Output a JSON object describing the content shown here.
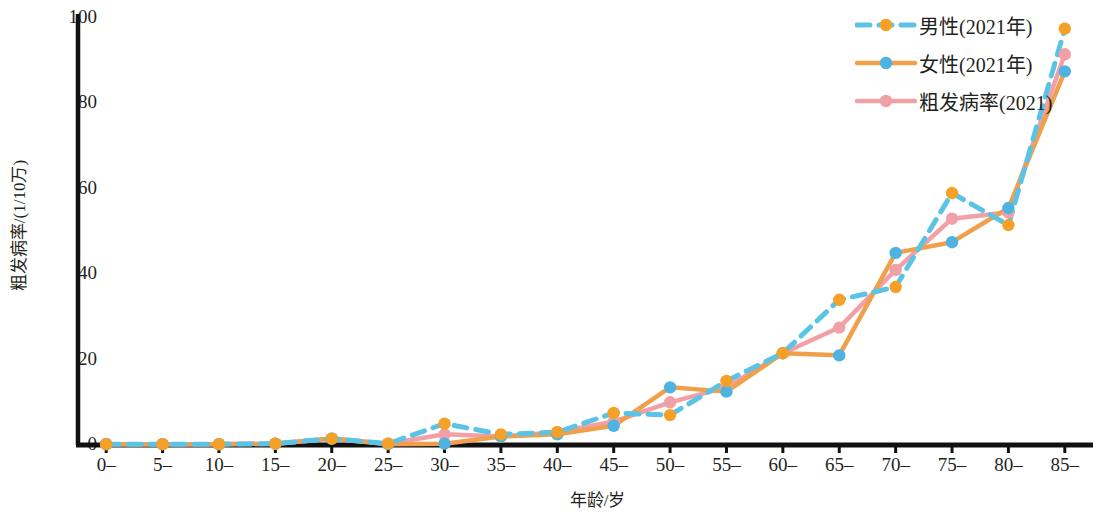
{
  "chart_data": {
    "type": "line",
    "title": "",
    "xlabel": "年龄/岁",
    "ylabel": "粗发病率/(1/10万)",
    "xlim": [
      0,
      17
    ],
    "ylim": [
      0,
      100
    ],
    "yticks": [
      0,
      20,
      40,
      60,
      80,
      100
    ],
    "ytick_labels": [
      "0",
      "20",
      "40",
      "60",
      "80",
      "100"
    ],
    "grid": false,
    "legend_position": "top-right",
    "categories": [
      "0–",
      "5–",
      "10–",
      "15–",
      "20–",
      "25–",
      "30–",
      "35–",
      "40–",
      "45–",
      "50–",
      "55–",
      "60–",
      "65–",
      "70–",
      "75–",
      "80–",
      "85–"
    ],
    "series": [
      {
        "name": "男性(2021年)",
        "line_color": "#5bc3e5",
        "line_style": "dashed",
        "marker_color": "#f5a026",
        "values": [
          0.2,
          0.2,
          0.2,
          0.3,
          1.5,
          0.3,
          5.0,
          2.5,
          3.0,
          7.5,
          7.0,
          15.0,
          21.5,
          34.0,
          37.0,
          59.0,
          51.5,
          97.5
        ]
      },
      {
        "name": "女性(2021年)",
        "line_color": "#f0a04b",
        "line_style": "solid",
        "marker_color": "#4eb3e0",
        "values": [
          0.2,
          0.2,
          0.2,
          0.3,
          1.5,
          0.2,
          0.3,
          2.0,
          2.5,
          4.5,
          13.5,
          12.5,
          21.5,
          21.0,
          45.0,
          47.5,
          55.5,
          87.5
        ]
      },
      {
        "name": "粗发病率(2021)",
        "line_color": "#f2a0a8",
        "line_style": "solid",
        "marker_color": "#f2a0a8",
        "values": [
          0.2,
          0.2,
          0.2,
          0.3,
          1.5,
          0.3,
          2.5,
          2.0,
          3.0,
          5.5,
          10.0,
          13.5,
          21.5,
          27.5,
          41.0,
          53.0,
          54.5,
          91.5
        ]
      }
    ]
  },
  "axes": {
    "axis_color": "#111111"
  }
}
